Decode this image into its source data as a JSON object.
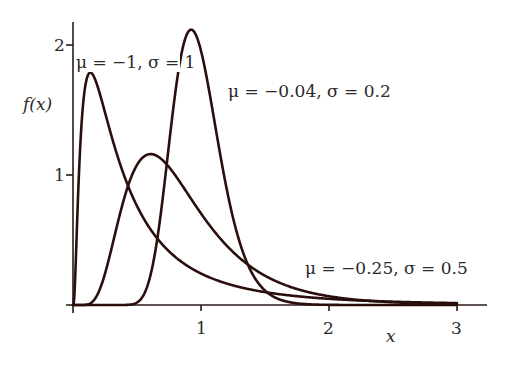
{
  "chart_data": {
    "type": "line",
    "title": "",
    "xlabel": "x",
    "ylabel": "f(x)",
    "xlim": [
      0,
      3.2
    ],
    "ylim": [
      0,
      2.2
    ],
    "x_ticks": [
      1,
      2,
      3
    ],
    "x_tick_labels": [
      "1",
      "2",
      "3"
    ],
    "y_ticks": [
      1,
      2
    ],
    "y_tick_labels": [
      "1",
      "2"
    ],
    "grid": false,
    "legend": "inline annotations",
    "series": [
      {
        "name": "μ = −1, σ = 1",
        "distribution": "lognormal",
        "mu": -1,
        "sigma": 1,
        "peak": {
          "x": 0.16,
          "y": 1.78
        },
        "x_range": [
          0.0,
          3.0
        ]
      },
      {
        "name": "μ = −0.25, σ = 0.5",
        "distribution": "lognormal",
        "mu": -0.25,
        "sigma": 0.5,
        "peak": {
          "x": 0.6,
          "y": 1.14
        },
        "x_range": [
          0.0,
          3.0
        ]
      },
      {
        "name": "μ = −0.04, σ = 0.2",
        "distribution": "lognormal",
        "mu": -0.04,
        "sigma": 0.2,
        "peak": {
          "x": 0.93,
          "y": 2.13
        },
        "x_range": [
          0.0,
          3.0
        ]
      }
    ]
  },
  "labels": {
    "series1": "μ = −1, σ = 1",
    "series2": "μ = −0.04, σ = 0.2",
    "series3": "μ = −0.25, σ = 0.5",
    "xlabel": "x",
    "ylabel": "f(x)",
    "xtick1": "1",
    "xtick2": "2",
    "xtick3": "3",
    "ytick1": "1",
    "ytick2": "2"
  },
  "colors": {
    "curve": "#2b0f0c",
    "axis": "#2b1a18",
    "text": "#2a2a2a",
    "background": "#ffffff"
  }
}
